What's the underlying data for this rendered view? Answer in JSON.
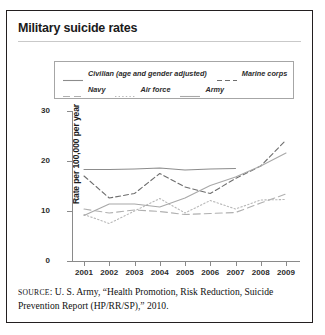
{
  "figure": {
    "title": "Military suicide rates",
    "source_prefix": "SOURCE",
    "source_text": ": U. S. Army, “Health Promotion, Risk Reduction, Suicide Prevention Report (HP/RR/SP),” 2010."
  },
  "chart_data": {
    "type": "line",
    "title": "Military suicide rates",
    "xlabel": "",
    "ylabel": "Rate per 100,000 per year",
    "x": [
      2001,
      2002,
      2003,
      2004,
      2005,
      2006,
      2007,
      2008,
      2009
    ],
    "xticklabels": [
      "2001",
      "2002",
      "2003",
      "2004",
      "2005",
      "2006",
      "2007",
      "2008",
      "2009"
    ],
    "yticklabels": [
      "0",
      "10",
      "20",
      "30"
    ],
    "yticks": [
      0,
      10,
      20,
      30
    ],
    "ylim": [
      0,
      30
    ],
    "xlim": [
      2001,
      2009
    ],
    "grid": false,
    "legend_position": "above-plot",
    "series": [
      {
        "name": "Civilian (age and gender adjusted)",
        "style": "solid",
        "color": "#8c8c8c",
        "x": [
          2001,
          2002,
          2003,
          2004,
          2005,
          2006,
          2007
        ],
        "values": [
          18.3,
          18.3,
          18.4,
          18.6,
          18.2,
          18.4,
          18.5
        ]
      },
      {
        "name": "Marine corps",
        "style": "dashed",
        "color": "#6e6e6e",
        "x": [
          2001,
          2002,
          2003,
          2004,
          2005,
          2006,
          2007,
          2008,
          2009
        ],
        "values": [
          17.0,
          12.6,
          13.5,
          17.5,
          14.8,
          13.5,
          16.5,
          19.0,
          24.2
        ]
      },
      {
        "name": "Navy",
        "style": "longdash",
        "color": "#b0b0b0",
        "x": [
          2001,
          2002,
          2003,
          2004,
          2005,
          2006,
          2007,
          2008,
          2009
        ],
        "values": [
          10.4,
          9.6,
          10.2,
          9.9,
          9.3,
          9.5,
          9.7,
          11.6,
          13.4
        ]
      },
      {
        "name": "Air force",
        "style": "dotted",
        "color": "#b8b8b8",
        "x": [
          2001,
          2002,
          2003,
          2004,
          2005,
          2006,
          2007,
          2008,
          2009
        ],
        "values": [
          9.3,
          7.5,
          10.0,
          12.5,
          9.6,
          12.1,
          10.4,
          12.2,
          12.3
        ]
      },
      {
        "name": "Army",
        "style": "solid",
        "color": "#a8a8a8",
        "x": [
          2001,
          2002,
          2003,
          2004,
          2005,
          2006,
          2007,
          2008,
          2009
        ],
        "values": [
          9.1,
          11.4,
          11.4,
          10.8,
          12.6,
          15.1,
          16.8,
          19.0,
          21.6
        ]
      }
    ],
    "legend_rows": [
      [
        {
          "label": "Civilian (age and gender adjusted)",
          "style": "solid",
          "color": "#8c8c8c"
        },
        {
          "label": "Marine corps",
          "style": "dashed",
          "color": "#6e6e6e"
        }
      ],
      [
        {
          "label": "Navy",
          "style": "longdash",
          "color": "#b0b0b0"
        },
        {
          "label": "Air force",
          "style": "dotted",
          "color": "#b8b8b8"
        },
        {
          "label": "Army",
          "style": "solid",
          "color": "#a8a8a8"
        }
      ]
    ]
  }
}
